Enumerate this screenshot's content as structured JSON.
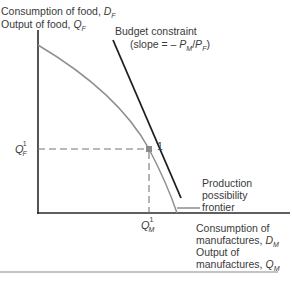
{
  "y_axis": {
    "line1": {
      "text": "Consumption of food, ",
      "var": "D",
      "sub": "F"
    },
    "line2": {
      "text": "Output of food, ",
      "var": "Q",
      "sub": "F"
    }
  },
  "x_axis": {
    "line1": "Consumption of",
    "line2": {
      "text": "manufactures, ",
      "var": "D",
      "sub": "M"
    },
    "line3": "Output of",
    "line4": {
      "text": "manufactures, ",
      "var": "Q",
      "sub": "M"
    }
  },
  "budget_constraint": {
    "label": "Budget constraint",
    "slope_prefix": "(slope = – ",
    "p1": "P",
    "p1_sub": "M",
    "slash": "/",
    "p2": "P",
    "p2_sub": "F",
    "slope_suffix": ")"
  },
  "ppf": {
    "line1": "Production",
    "line2": "possibility",
    "line3": "frontier"
  },
  "point": {
    "label": "1"
  },
  "tick_y": {
    "var": "Q",
    "sub": "F",
    "sup": "1"
  },
  "tick_x": {
    "var": "Q",
    "sub": "M",
    "sup": "1"
  },
  "colors": {
    "axis": "#2a2a2a",
    "budget_line": "#1e1e1e",
    "ppf_curve": "#8f8f8f",
    "dashed": "#777777",
    "point": "#8a8a8a",
    "rule": "#c4c4c4"
  }
}
